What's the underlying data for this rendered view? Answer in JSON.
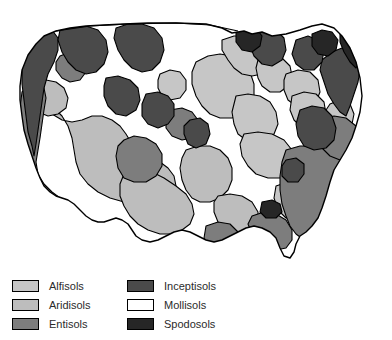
{
  "figure": {
    "kind": "thematic-map",
    "region": "contiguous-united-states",
    "background_color": "#ffffff",
    "outline_color": "#000000"
  },
  "map": {
    "name": "soil-orders-map",
    "description": "Shaded map of the contiguous United States showing dominant soil orders",
    "border_color": "#000000"
  },
  "legend": {
    "columns": [
      {
        "name": "legend-column-left",
        "items": [
          {
            "label": "Alfisols",
            "color": "#c6c6c6",
            "swatch_name": "legend-swatch-alfisols"
          },
          {
            "label": "Aridisols",
            "color": "#bdbdbd",
            "swatch_name": "legend-swatch-aridisols"
          },
          {
            "label": "Entisols",
            "color": "#7d7d7d",
            "swatch_name": "legend-swatch-entisols"
          }
        ]
      },
      {
        "name": "legend-column-right",
        "items": [
          {
            "label": "Inceptisols",
            "color": "#4a4a4a",
            "swatch_name": "legend-swatch-inceptisols"
          },
          {
            "label": "Mollisols",
            "color": "#ffffff",
            "swatch_name": "legend-swatch-mollisols"
          },
          {
            "label": "Spodosols",
            "color": "#262626",
            "swatch_name": "legend-swatch-spodosols"
          }
        ]
      }
    ]
  },
  "colors": {
    "alfisols": "#c6c6c6",
    "aridisols": "#bdbdbd",
    "entisols": "#7d7d7d",
    "inceptisols": "#4a4a4a",
    "mollisols": "#ffffff",
    "spodosols": "#262626",
    "stroke": "#000000",
    "text": "#2b2b2b"
  }
}
